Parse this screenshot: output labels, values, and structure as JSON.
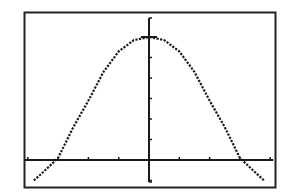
{
  "display": {
    "frame": {
      "x": 24,
      "y": 12,
      "width": 252,
      "height": 176,
      "color": "#222222"
    },
    "background": "#ffffff",
    "ink": "#1a1a1a"
  },
  "chart_data": {
    "type": "line",
    "title": "",
    "xlabel": "",
    "ylabel": "",
    "grid": false,
    "legend": "none",
    "xlim": [
      -4.2,
      4.2
    ],
    "ylim": [
      -1.4,
      7.1
    ],
    "x_ticks": [
      -4,
      -3,
      -2,
      -1,
      0,
      1,
      2,
      3,
      4
    ],
    "y_ticks": [
      -1,
      1,
      2,
      3,
      4,
      5,
      6
    ],
    "tick_labels_shown": false,
    "series": [
      {
        "name": "y1",
        "style": "dotted-pixel",
        "x": [
          -3.8,
          -3.5,
          -3.0,
          -2.5,
          -2.0,
          -1.5,
          -1.0,
          -0.5,
          0,
          0.5,
          1.0,
          1.5,
          2.0,
          2.5,
          3.0,
          3.5,
          3.8
        ],
        "y": [
          -1.0,
          -0.6,
          0.1,
          1.6,
          2.9,
          4.3,
          5.3,
          5.85,
          6.0,
          5.85,
          5.3,
          4.3,
          2.9,
          1.6,
          0.1,
          -0.6,
          -1.0
        ]
      }
    ],
    "annotations": []
  }
}
